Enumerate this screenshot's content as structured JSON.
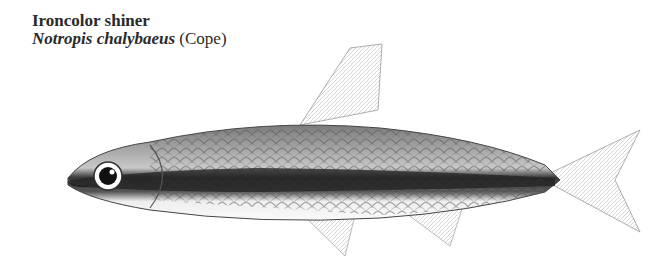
{
  "caption": {
    "common_name": "Ironcolor shiner",
    "scientific_name": "Notropis chalybaeus",
    "authority": "(Cope)"
  },
  "illustration": {
    "subject": "fish-illustration",
    "style": "monochrome scientific drawing"
  }
}
